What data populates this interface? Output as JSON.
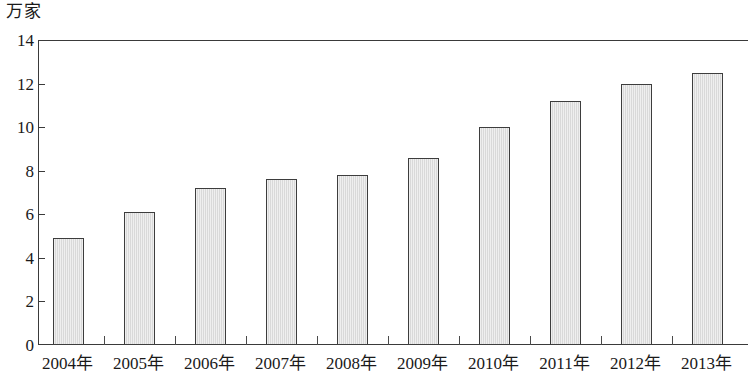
{
  "chart_data": {
    "type": "bar",
    "title": "",
    "subtitle": "",
    "unit_label": "万家",
    "xlabel": "",
    "ylabel": "万家",
    "ylim": [
      0,
      14
    ],
    "ytick_values": [
      0,
      2,
      4,
      6,
      8,
      10,
      12,
      14
    ],
    "ytick_labels": [
      "0",
      "2",
      "4",
      "6",
      "8",
      "10",
      "12",
      "14"
    ],
    "grid": false,
    "legend": null,
    "categories": [
      "2004年",
      "2005年",
      "2006年",
      "2007年",
      "2008年",
      "2009年",
      "2010年",
      "2011年",
      "2012年",
      "2013年"
    ],
    "values": [
      4.9,
      6.1,
      7.2,
      7.6,
      7.8,
      8.6,
      10.0,
      11.2,
      12.0,
      12.5
    ],
    "bar_fill_color": "#dcdcdc",
    "bar_border_color": "#3d3d3d",
    "axis_color": "#3a3a3a",
    "background_color": "#ffffff"
  }
}
